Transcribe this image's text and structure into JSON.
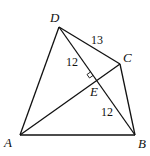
{
  "diagram": {
    "type": "quadrilateral with diagonals",
    "points": [
      {
        "id": "A",
        "label": "A"
      },
      {
        "id": "B",
        "label": "B"
      },
      {
        "id": "C",
        "label": "C"
      },
      {
        "id": "D",
        "label": "D"
      },
      {
        "id": "E",
        "label": "E"
      }
    ],
    "segments": [
      {
        "from": "A",
        "to": "B"
      },
      {
        "from": "B",
        "to": "C"
      },
      {
        "from": "C",
        "to": "D"
      },
      {
        "from": "D",
        "to": "A"
      },
      {
        "from": "A",
        "to": "C"
      },
      {
        "from": "D",
        "to": "B"
      }
    ],
    "lengths": [
      {
        "segment": "DC",
        "value": "13"
      },
      {
        "segment": "DE",
        "value": "12"
      },
      {
        "segment": "EB",
        "value": "12"
      }
    ],
    "right_angle_at": "E",
    "note": "AC ⊥ BD at E"
  }
}
